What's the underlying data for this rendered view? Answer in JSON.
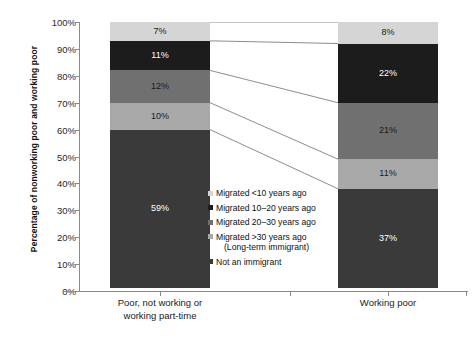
{
  "chart_data": {
    "type": "bar",
    "subtype": "stacked-bar-100-percent-with-connectors",
    "title": "",
    "xlabel": "",
    "ylabel": "Percentage of nonworking poor and working poor",
    "categories": [
      "Poor, not working or working part-time",
      "Working poor"
    ],
    "ylim": [
      0,
      100
    ],
    "ytick_labels": [
      "0%",
      "10%",
      "20%",
      "30%",
      "40%",
      "50%",
      "60%",
      "70%",
      "80%",
      "90%",
      "100%"
    ],
    "ytick_values": [
      0,
      10,
      20,
      30,
      40,
      50,
      60,
      70,
      80,
      90,
      100
    ],
    "grid": false,
    "legend_position": "inside-center",
    "stack_order_bottom_to_top": [
      "Not an immigrant",
      "Migrated >30 years ago (Long-term immigrant)",
      "Migrated 20-30 years ago",
      "Migrated 10-20 years ago",
      "Migrated <10 years ago"
    ],
    "series": [
      {
        "name": "Not an immigrant",
        "color": "#3a3a3a",
        "label_color": "#ffffff",
        "values": [
          59,
          37
        ],
        "value_labels": [
          "59%",
          "37%"
        ]
      },
      {
        "name": "Migrated >30 years ago (Long-term immigrant)",
        "color": "#a9a9a9",
        "label_color": "#1a1a1a",
        "values": [
          10,
          11
        ],
        "value_labels": [
          "10%",
          "11%"
        ]
      },
      {
        "name": "Migrated 20-30 years ago",
        "color": "#707070",
        "label_color": "#1a1a1a",
        "values": [
          12,
          21
        ],
        "value_labels": [
          "12%",
          "21%"
        ]
      },
      {
        "name": "Migrated 10-20 years ago",
        "color": "#1c1c1c",
        "label_color": "#ffffff",
        "values": [
          11,
          22
        ],
        "value_labels": [
          "11%",
          "22%"
        ]
      },
      {
        "name": "Migrated <10 years ago",
        "color": "#d5d5d5",
        "label_color": "#1a1a1a",
        "values": [
          7,
          8
        ],
        "value_labels": [
          "7%",
          "8%"
        ]
      }
    ]
  },
  "axis": {
    "y_title": "Percentage of nonworking poor and working poor",
    "y_ticks": [
      "100%",
      "90%",
      "80%",
      "70%",
      "60%",
      "50%",
      "40%",
      "30%",
      "20%",
      "10%",
      "0%"
    ],
    "x_tick_1_line1": "Poor, not working or",
    "x_tick_1_line2": "working part-time",
    "x_tick_2_line1": "Working poor",
    "x_tick_2_line2": ""
  },
  "bars": {
    "left": {
      "category": "Poor, not working or working part-time",
      "segments": [
        {
          "key": "lt10",
          "label": "7%",
          "value": 7,
          "color": "#d5d5d5",
          "text_color": "#1a1a1a"
        },
        {
          "key": "b1020",
          "label": "11%",
          "value": 11,
          "color": "#1c1c1c",
          "text_color": "#ffffff"
        },
        {
          "key": "b2030",
          "label": "12%",
          "value": 12,
          "color": "#707070",
          "text_color": "#1a1a1a"
        },
        {
          "key": "gt30",
          "label": "10%",
          "value": 10,
          "color": "#a9a9a9",
          "text_color": "#1a1a1a"
        },
        {
          "key": "native",
          "label": "59%",
          "value": 59,
          "color": "#3a3a3a",
          "text_color": "#ffffff"
        }
      ]
    },
    "right": {
      "category": "Working poor",
      "segments": [
        {
          "key": "lt10",
          "label": "8%",
          "value": 8,
          "color": "#d5d5d5",
          "text_color": "#1a1a1a"
        },
        {
          "key": "b1020",
          "label": "22%",
          "value": 22,
          "color": "#1c1c1c",
          "text_color": "#ffffff"
        },
        {
          "key": "b2030",
          "label": "21%",
          "value": 21,
          "color": "#707070",
          "text_color": "#1a1a1a"
        },
        {
          "key": "gt30",
          "label": "11%",
          "value": 11,
          "color": "#a9a9a9",
          "text_color": "#1a1a1a"
        },
        {
          "key": "native",
          "label": "37%",
          "value": 37,
          "color": "#3a3a3a",
          "text_color": "#ffffff"
        }
      ]
    }
  },
  "legend": {
    "items": [
      {
        "label": "Migrated <10 years ago",
        "sub": "",
        "color": "#d5d5d5"
      },
      {
        "label": "Migrated 10–20 years ago",
        "sub": "",
        "color": "#1c1c1c"
      },
      {
        "label": "Migrated 20–30 years ago",
        "sub": "",
        "color": "#707070"
      },
      {
        "label": "Migrated >30 years ago",
        "sub": "(Long-term immigrant)",
        "color": "#a9a9a9"
      },
      {
        "label": "Not an immigrant",
        "sub": "",
        "color": "#3a3a3a"
      }
    ]
  },
  "style": {
    "axis_color": "#8a8a8a",
    "connector_color": "#6e6e6e",
    "background": "#ffffff"
  }
}
